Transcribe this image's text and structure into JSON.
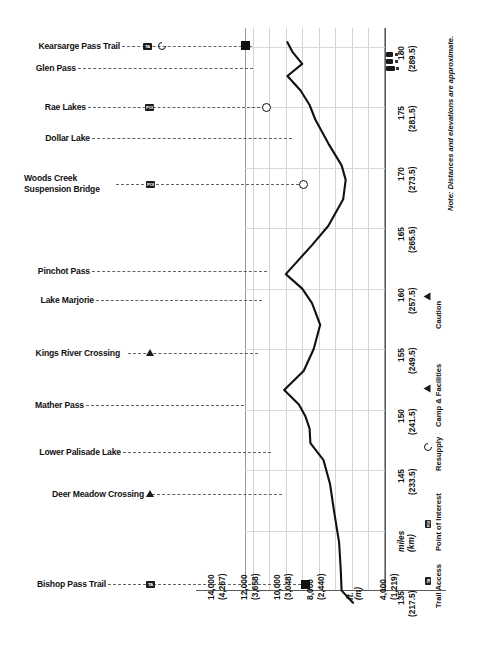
{
  "chart_data": {
    "type": "line",
    "orientation": "vertical-distance",
    "xlabel": "ft. (m)",
    "ylabel": "miles (km)",
    "note": "Note: Distances and elevations are approximate.",
    "elevation_axis": {
      "unit_label_ft": "ft.",
      "unit_label_m": "(m)",
      "ticks": [
        {
          "ft": "14,000",
          "m": "(4,267)"
        },
        {
          "ft": "12,000",
          "m": "(3,658)"
        },
        {
          "ft": "10,000",
          "m": "(3,048)"
        },
        {
          "ft": "8,000",
          "m": "(2,440)"
        },
        {
          "ft": "",
          "m": ""
        },
        {
          "ft": "4,000",
          "m": "(1,219)"
        }
      ],
      "range_ft": [
        4000,
        15000
      ]
    },
    "distance_axis": {
      "unit_label_miles": "miles",
      "unit_label_km": "(km)",
      "ticks": [
        {
          "mi": "135",
          "km": "(217.5)"
        },
        {
          "mi": "145",
          "km": "(233.5)"
        },
        {
          "mi": "150",
          "km": "(241.5)"
        },
        {
          "mi": "155",
          "km": "(249.5)"
        },
        {
          "mi": "160",
          "km": "(257.5)"
        },
        {
          "mi": "165",
          "km": "(265.5)"
        },
        {
          "mi": "170",
          "km": "(273.5)"
        },
        {
          "mi": "175",
          "km": "(281.5)"
        },
        {
          "mi": "180",
          "km": "(289.5)"
        }
      ],
      "range_mi": [
        133,
        182
      ]
    },
    "series": [
      {
        "name": "Elevation profile",
        "points": [
          {
            "mile": 134.0,
            "elev_ft": 7900
          },
          {
            "mile": 135.0,
            "elev_ft": 8600
          },
          {
            "mile": 136.8,
            "elev_ft": 8650
          },
          {
            "mile": 139.0,
            "elev_ft": 8750
          },
          {
            "mile": 141.5,
            "elev_ft": 9050
          },
          {
            "mile": 143.8,
            "elev_ft": 9300
          },
          {
            "mile": 145.8,
            "elev_ft": 9700
          },
          {
            "mile": 147.2,
            "elev_ft": 10500
          },
          {
            "mile": 148.4,
            "elev_ft": 10550
          },
          {
            "mile": 149.4,
            "elev_ft": 10800
          },
          {
            "mile": 150.4,
            "elev_ft": 11200
          },
          {
            "mile": 151.6,
            "elev_ft": 12100
          },
          {
            "mile": 153.2,
            "elev_ft": 10900
          },
          {
            "mile": 155.0,
            "elev_ft": 10300
          },
          {
            "mile": 157.0,
            "elev_ft": 9900
          },
          {
            "mile": 158.8,
            "elev_ft": 10400
          },
          {
            "mile": 160.0,
            "elev_ft": 11000
          },
          {
            "mile": 161.2,
            "elev_ft": 12000
          },
          {
            "mile": 162.4,
            "elev_ft": 11200
          },
          {
            "mile": 163.6,
            "elev_ft": 10400
          },
          {
            "mile": 165.2,
            "elev_ft": 9400
          },
          {
            "mile": 167.4,
            "elev_ft": 8500
          },
          {
            "mile": 169.0,
            "elev_ft": 8350
          },
          {
            "mile": 170.2,
            "elev_ft": 8600
          },
          {
            "mile": 172.0,
            "elev_ft": 9400
          },
          {
            "mile": 174.0,
            "elev_ft": 10200
          },
          {
            "mile": 175.2,
            "elev_ft": 10550
          },
          {
            "mile": 176.4,
            "elev_ft": 11100
          },
          {
            "mile": 177.6,
            "elev_ft": 11900
          },
          {
            "mile": 178.6,
            "elev_ft": 11000
          },
          {
            "mile": 179.6,
            "elev_ft": 11600
          },
          {
            "mile": 180.4,
            "elev_ft": 11900
          }
        ]
      }
    ],
    "markers": [
      {
        "label": "Bishop Pass Trail",
        "shape": "square",
        "mile": 135.0,
        "elev_ft": 8600
      },
      {
        "label": "Mather Pass",
        "shape": "diamond",
        "mile": 151.6,
        "elev_ft": 12100
      },
      {
        "label": "Pinchot Pass",
        "shape": "diamond",
        "mile": 161.2,
        "elev_ft": 12000
      },
      {
        "label": "Woods Creek Suspension Bridge",
        "shape": "circle",
        "mile": 169.0,
        "elev_ft": 8350
      },
      {
        "label": "Rae Lakes",
        "shape": "circle",
        "mile": 175.2,
        "elev_ft": 10550
      },
      {
        "label": "Kearsarge Pass Trail",
        "shape": "square",
        "mile": 179.6,
        "elev_ft": 11600
      }
    ],
    "waypoints": [
      {
        "label": "Kearsarge Pass Trail",
        "icons": [
          "trail-access",
          "resupply"
        ],
        "mile": 179.6
      },
      {
        "label": "Glen Pass",
        "icons": [],
        "mile": 177.6
      },
      {
        "label": "Rae Lakes",
        "icons": [
          "point-of-interest"
        ],
        "mile": 175.2
      },
      {
        "label": "Dollar Lake",
        "icons": [],
        "mile": 173.2
      },
      {
        "label": "Woods Creek\nSuspension Bridge",
        "icons": [
          "point-of-interest"
        ],
        "mile": 169.0
      },
      {
        "label": "Pinchot Pass",
        "icons": [],
        "mile": 161.2
      },
      {
        "label": "Lake Marjorie",
        "icons": [],
        "mile": 159.0
      },
      {
        "label": "Kings River Crossing",
        "icons": [
          "caution"
        ],
        "mile": 155.0
      },
      {
        "label": "Mather Pass",
        "icons": [],
        "mile": 151.6
      },
      {
        "label": "Lower Palisade Lake",
        "icons": [],
        "mile": 148.4
      },
      {
        "label": "Deer Meadow Crossing",
        "icons": [
          "caution"
        ],
        "mile": 145.0
      },
      {
        "label": "Bishop Pass Trail",
        "icons": [
          "trail-access"
        ],
        "mile": 135.0
      }
    ],
    "legend": [
      {
        "icon": "trail-access-badge",
        "label": "Trail Access"
      },
      {
        "icon": "point-of-interest-badge",
        "label": "Point of Interest"
      },
      {
        "icon": "resupply-icon",
        "label": "Resupply"
      },
      {
        "icon": "camp-facilities-icon",
        "label": "Camp & Facilities"
      },
      {
        "icon": "caution-icon",
        "label": "Caution"
      }
    ],
    "badge_text": {
      "trail_access": "TA",
      "point_of_interest": "POI"
    },
    "colors": {
      "profile_line": "#111111",
      "grid": "#d6d6d6",
      "axis": "#5a5a5a",
      "badge_bg": "#1b1b1b",
      "text": "#111111"
    }
  }
}
